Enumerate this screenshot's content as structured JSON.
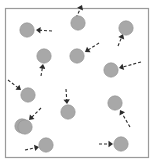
{
  "figure": {
    "width": 155,
    "height": 165,
    "background_color": "#ffffff"
  },
  "container_box": {
    "name": "particle-container-box",
    "x": 5,
    "y": 8,
    "width": 143,
    "height": 149,
    "border_color": "#9a9a9a",
    "border_width": 1.2,
    "fill_color": "#ffffff"
  },
  "style": {
    "particle_fill": "#a8a8a8",
    "particle_stroke": "#8f8f8f",
    "particle_stroke_width": 0.6,
    "particle_radius": 7.2,
    "arrow_color": "#2b2b2b",
    "arrow_width": 1.1,
    "arrow_dash": "3,2",
    "arrow_head_length": 4.5,
    "arrow_head_width": 3.2
  },
  "chart_data": {
    "type": "scatter",
    "xlabel": "",
    "ylabel": "",
    "xlim": [
      5,
      148
    ],
    "ylim": [
      8,
      157
    ],
    "grid": false,
    "legend": "none",
    "marker": "filled-circle",
    "marker_color": "#a8a8a8",
    "marker_radius": 7.2,
    "n_points": 13,
    "particles": [
      {
        "id": 1,
        "label": "particle-top-left",
        "x": 27,
        "y": 30,
        "vx": -1.0,
        "vy": 0.0,
        "arrow_tail_x": 52,
        "arrow_tail_y": 31,
        "arrow_tip_x": 36,
        "arrow_tip_y": 30
      },
      {
        "id": 2,
        "label": "particle-top-center",
        "x": 78,
        "y": 23,
        "vx": 0.55,
        "vy": -0.85,
        "arrow_tail_x": 76,
        "arrow_tail_y": 18,
        "arrow_tip_x": 82,
        "arrow_tip_y": 5
      },
      {
        "id": 3,
        "label": "particle-top-right",
        "x": 126,
        "y": 28,
        "vx": 0.52,
        "vy": -0.85,
        "arrow_tail_x": 118,
        "arrow_tail_y": 46,
        "arrow_tip_x": 123,
        "arrow_tip_y": 34
      },
      {
        "id": 4,
        "label": "particle-upper-mid-left",
        "x": 44,
        "y": 56,
        "vx": 0.12,
        "vy": -1.0,
        "arrow_tail_x": 41,
        "arrow_tail_y": 76,
        "arrow_tip_x": 43,
        "arrow_tip_y": 64
      },
      {
        "id": 5,
        "label": "particle-upper-mid-center",
        "x": 77,
        "y": 56,
        "vx": -0.8,
        "vy": -0.6,
        "arrow_tail_x": 99,
        "arrow_tail_y": 43,
        "arrow_tip_x": 85,
        "arrow_tip_y": 52
      },
      {
        "id": 6,
        "label": "particle-mid-right",
        "x": 111,
        "y": 70,
        "vx": -0.95,
        "vy": -0.3,
        "arrow_tail_x": 141,
        "arrow_tail_y": 62,
        "arrow_tip_x": 119,
        "arrow_tip_y": 68
      },
      {
        "id": 7,
        "label": "particle-mid-left",
        "x": 28,
        "y": 95,
        "vx": 0.8,
        "vy": 0.6,
        "arrow_tail_x": 8,
        "arrow_tail_y": 80,
        "arrow_tip_x": 21,
        "arrow_tip_y": 90
      },
      {
        "id": 8,
        "label": "particle-center-low",
        "x": 68,
        "y": 112,
        "vx": 0.05,
        "vy": 1.0,
        "arrow_tail_x": 66,
        "arrow_tail_y": 89,
        "arrow_tip_x": 67,
        "arrow_tip_y": 104
      },
      {
        "id": 9,
        "label": "particle-lower-right",
        "x": 115,
        "y": 103,
        "vx": -0.55,
        "vy": -0.83,
        "arrow_tail_x": 130,
        "arrow_tail_y": 127,
        "arrow_tip_x": 120,
        "arrow_tip_y": 110
      },
      {
        "id": 10,
        "label": "particle-lower-left",
        "x": 22,
        "y": 126,
        "vx": -0.72,
        "vy": 0.69,
        "arrow_tail_x": 41,
        "arrow_tail_y": 108,
        "arrow_tip_x": 29,
        "arrow_tip_y": 120
      },
      {
        "id": 11,
        "label": "particle-bottom-left",
        "x": 46,
        "y": 145,
        "vx": 1.0,
        "vy": -0.2,
        "arrow_tail_x": 25,
        "arrow_tail_y": 150,
        "arrow_tip_x": 39,
        "arrow_tip_y": 147
      },
      {
        "id": 12,
        "label": "particle-bottom-right",
        "x": 121,
        "y": 144,
        "vx": -1.0,
        "vy": 0.0,
        "arrow_tail_x": 99,
        "arrow_tail_y": 144,
        "arrow_tip_x": 113,
        "arrow_tip_y": 144
      },
      {
        "id": 13,
        "label": "particle-left-upper-edge",
        "x": 25,
        "y": 127,
        "vx": 0,
        "vy": 0,
        "arrow_tail_x": null,
        "arrow_tail_y": null,
        "arrow_tip_x": null,
        "arrow_tip_y": null
      }
    ]
  }
}
